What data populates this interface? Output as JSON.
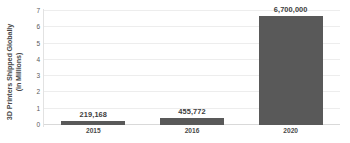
{
  "chart_data": {
    "type": "bar",
    "title": "",
    "xlabel": "",
    "ylabel": "3D Printers Shipped Globally (in Millions)",
    "ylabel_line1": "3D Printers Shipped Globally",
    "ylabel_line2": "(in Millions)",
    "categories": [
      "2015",
      "2016",
      "2020"
    ],
    "values": [
      0.219168,
      0.455772,
      6.7
    ],
    "data_labels": [
      "219,168",
      "455,772",
      "6,700,000"
    ],
    "ylim": [
      0,
      7
    ],
    "yticks": [
      0,
      1,
      2,
      3,
      4,
      5,
      6,
      7
    ],
    "ytick_labels": [
      "0",
      "1",
      "2",
      "3",
      "4",
      "5",
      "6",
      "7"
    ],
    "grid": true,
    "grid_axis": "y",
    "legend": false,
    "legend_position": "none",
    "bar_color": "#595959",
    "gridline_color": "#ededed",
    "axis_color": "#d9d9d9",
    "label_color": "#3d3d3d",
    "background": "#ffffff"
  }
}
